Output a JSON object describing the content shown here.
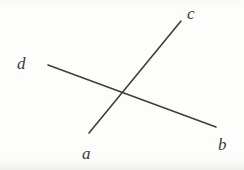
{
  "figure": {
    "background_color": "#fdfdfb",
    "stroke_color": "#3f3f3f",
    "label_color": "#3a3a3a",
    "stroke_width": 1.6,
    "width": 244,
    "height": 170
  },
  "labels": {
    "a": "a",
    "b": "b",
    "c": "c",
    "d": "d"
  },
  "geometry": {
    "intersection": {
      "x": 121,
      "y": 94
    },
    "segments": [
      {
        "name": "line-ac",
        "from_label": "a",
        "to_label": "c",
        "x1": 89,
        "y1": 133,
        "x2": 181,
        "y2": 21
      },
      {
        "name": "line-db",
        "from_label": "d",
        "to_label": "b",
        "x1": 48,
        "y1": 65,
        "x2": 216,
        "y2": 127
      }
    ],
    "label_positions": {
      "a": {
        "x": 82,
        "y": 145
      },
      "b": {
        "x": 218,
        "y": 136
      },
      "c": {
        "x": 187,
        "y": 5
      },
      "d": {
        "x": 17,
        "y": 55
      }
    }
  }
}
